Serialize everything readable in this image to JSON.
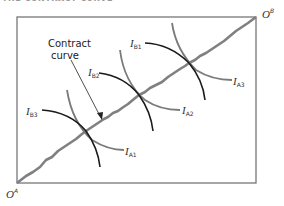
{
  "title": "THE CONTRACT CURVE",
  "origin_a": {
    "label": "O",
    "sup": "A"
  },
  "origin_b": {
    "label": "O",
    "sup": "B"
  },
  "annotation": {
    "line1": "Contract",
    "line2": "curve"
  },
  "indifference_curves": {
    "A": [
      {
        "label": "I",
        "sub": "A1"
      },
      {
        "label": "I",
        "sub": "A2"
      },
      {
        "label": "I",
        "sub": "A3"
      }
    ],
    "B": [
      {
        "label": "I",
        "sub": "B1"
      },
      {
        "label": "I",
        "sub": "B2"
      },
      {
        "label": "I",
        "sub": "B3"
      }
    ]
  },
  "colors": {
    "box": "#777777",
    "contract_curve": "#808080",
    "ic_a": "#7a7a7a",
    "ic_b": "#1a1a1a"
  }
}
